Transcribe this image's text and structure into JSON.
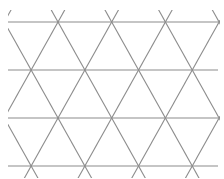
{
  "diagram": {
    "type": "triangular-lattice",
    "line_color": "#8c8c8c",
    "background": "#ffffff",
    "clip": {
      "x0": 8,
      "y0": 10,
      "x1": 220,
      "y1": 178
    },
    "horizontal_lines_y": [
      22,
      70,
      118,
      166
    ],
    "horizontal_x_range": [
      8,
      218
    ],
    "column_spacing": 53.7,
    "row_spacing": 48,
    "vertex_rows": [
      {
        "y": 22,
        "x": [
          58,
          112,
          166,
          220
        ]
      },
      {
        "y": 70,
        "x": [
          4,
          32,
          85,
          139,
          193
        ]
      },
      {
        "y": 118,
        "x": [
          58,
          112,
          166,
          220
        ]
      },
      {
        "y": 166,
        "x": [
          32,
          85,
          139,
          193
        ]
      }
    ]
  }
}
